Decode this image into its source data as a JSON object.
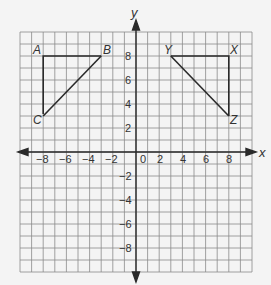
{
  "chart_data": {
    "type": "diagram",
    "title": "",
    "xlabel": "x",
    "ylabel": "y",
    "xlim": [
      -10,
      10
    ],
    "ylim": [
      -10,
      10
    ],
    "grid": true,
    "x_tick_labels": [
      "-8",
      "-6",
      "-4",
      "-2",
      "0",
      "2",
      "4",
      "6",
      "8"
    ],
    "y_tick_labels": [
      "8",
      "6",
      "4",
      "2",
      "-2",
      "-4",
      "-6",
      "-8"
    ],
    "shapes": [
      {
        "name": "triangle ABC",
        "vertices": [
          {
            "label": "A",
            "x": -8,
            "y": 8
          },
          {
            "label": "B",
            "x": -3,
            "y": 8
          },
          {
            "label": "C",
            "x": -8,
            "y": 3
          }
        ]
      },
      {
        "name": "triangle XYZ",
        "vertices": [
          {
            "label": "X",
            "x": 8,
            "y": 8
          },
          {
            "label": "Y",
            "x": 3,
            "y": 8
          },
          {
            "label": "Z",
            "x": 8,
            "y": 3
          }
        ]
      }
    ]
  },
  "labels": {
    "x_axis": "x",
    "y_axis": "y",
    "A": "A",
    "B": "B",
    "C": "C",
    "X": "X",
    "Y": "Y",
    "Z": "Z",
    "xt": [
      "−8",
      "−6",
      "−4",
      "−2",
      "0",
      "2",
      "4",
      "6",
      "8"
    ],
    "yt": [
      "8",
      "6",
      "4",
      "2",
      "−2",
      "−4",
      "−6",
      "−8"
    ]
  }
}
